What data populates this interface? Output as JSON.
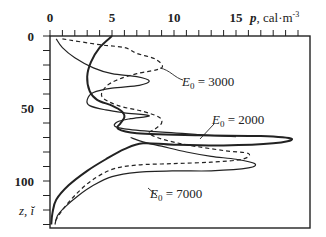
{
  "chart_data": {
    "type": "line",
    "title": "",
    "xlabel": "p, cal·m⁻³",
    "ylabel": "z, ĭ",
    "x_ticks": [
      "0",
      "5",
      "10",
      "15"
    ],
    "y_ticks": [
      "0",
      "50",
      "100"
    ],
    "xlim": [
      0,
      21
    ],
    "ylim": [
      132,
      0
    ],
    "grid": false,
    "axis_position": "x-axis on top, y inverted (depth)",
    "series": [
      {
        "name": "E0 = 2000",
        "style": "solid-thick",
        "points": [
          [
            5,
            0
          ],
          [
            4,
            8
          ],
          [
            3.3,
            18
          ],
          [
            3,
            28
          ],
          [
            3.2,
            38
          ],
          [
            3.8,
            44
          ],
          [
            5,
            48
          ],
          [
            5.8,
            52
          ],
          [
            6,
            56
          ],
          [
            5.7,
            60
          ],
          [
            5.5,
            64
          ],
          [
            7,
            67
          ],
          [
            12,
            68.5
          ],
          [
            17,
            69
          ],
          [
            19.5,
            71
          ],
          [
            18,
            74
          ],
          [
            14,
            75.5
          ],
          [
            10,
            75
          ],
          [
            7.5,
            74
          ],
          [
            6,
            78
          ],
          [
            4.5,
            85
          ],
          [
            3,
            93
          ],
          [
            1.5,
            103
          ],
          [
            0.5,
            113
          ],
          [
            0.2,
            122
          ],
          [
            0.1,
            130
          ]
        ]
      },
      {
        "name": "E0 = 3000",
        "style": "solid-thin",
        "points": [
          [
            0.5,
            2
          ],
          [
            1,
            8
          ],
          [
            2,
            15
          ],
          [
            3.5,
            22
          ],
          [
            5,
            26
          ],
          [
            7,
            28
          ],
          [
            8,
            31
          ],
          [
            7.2,
            34
          ],
          [
            5,
            36
          ],
          [
            3.5,
            39
          ],
          [
            3,
            44
          ],
          [
            3.2,
            48
          ],
          [
            4.5,
            51
          ],
          [
            6,
            53
          ],
          [
            8,
            55
          ],
          [
            6.5,
            57
          ],
          [
            5.5,
            59
          ],
          [
            5.2,
            62
          ],
          [
            6,
            64
          ],
          [
            8.5,
            66
          ],
          [
            12,
            68
          ],
          [
            15,
            69.5
          ]
        ]
      },
      {
        "name": "E0 = 7000",
        "style": "solid-thin",
        "points": [
          [
            6.5,
            70
          ],
          [
            7.5,
            73
          ],
          [
            9,
            76
          ],
          [
            11,
            80
          ],
          [
            13,
            83
          ],
          [
            15,
            85
          ],
          [
            16.5,
            88
          ],
          [
            16,
            91
          ],
          [
            13,
            93
          ],
          [
            10,
            93
          ],
          [
            7,
            94
          ],
          [
            5,
            97
          ],
          [
            3.5,
            103
          ],
          [
            2.3,
            110
          ],
          [
            1.2,
            118
          ],
          [
            0.6,
            124
          ],
          [
            0.4,
            130
          ]
        ]
      },
      {
        "name": "unlabeled dashed",
        "style": "dashed",
        "points": [
          [
            1,
            2
          ],
          [
            4,
            6
          ],
          [
            6,
            8
          ],
          [
            7,
            12
          ],
          [
            8.5,
            16
          ],
          [
            9,
            22
          ],
          [
            7,
            26
          ],
          [
            5.5,
            30
          ],
          [
            4.5,
            35
          ],
          [
            4.2,
            42
          ],
          [
            5.5,
            48
          ],
          [
            7.5,
            52
          ],
          [
            8.8,
            56
          ],
          [
            9,
            60
          ],
          [
            8.5,
            64
          ],
          [
            8,
            67
          ],
          [
            9,
            71
          ],
          [
            11,
            75
          ],
          [
            14,
            79
          ],
          [
            16,
            81
          ],
          [
            15.5,
            85
          ],
          [
            13,
            87
          ],
          [
            10,
            88
          ],
          [
            7,
            89
          ],
          [
            5,
            92
          ],
          [
            3.3,
            100
          ],
          [
            2,
            110
          ],
          [
            1,
            120
          ],
          [
            0.4,
            128
          ]
        ]
      }
    ],
    "annotations": [
      {
        "text_prefix": "E",
        "subscript": "0",
        "text_suffix": " = 3000",
        "x": 9.5,
        "y": 31
      },
      {
        "text_prefix": "E",
        "subscript": "0",
        "text_suffix": " = 2000",
        "x": 11.6,
        "y": 57
      },
      {
        "text_prefix": "E",
        "subscript": "0",
        "text_suffix": " = 7000",
        "x": 8.4,
        "y": 98
      }
    ]
  },
  "labels": {
    "x_axis_title_var": "p",
    "x_axis_title_unit": ", cal·m",
    "x_axis_title_exp": "-3",
    "y_axis_title": "z, ĭ",
    "ann_3000_E": "E",
    "ann_3000_sub": "0",
    "ann_3000_val": " = 3000",
    "ann_2000_E": "E",
    "ann_2000_sub": "0",
    "ann_2000_val": " = 2000",
    "ann_7000_E": "E",
    "ann_7000_sub": "0",
    "ann_7000_val": " = 7000",
    "xt0": "0",
    "xt5": "5",
    "xt10": "10",
    "xt15": "15",
    "yt0": "0",
    "yt50": "50",
    "yt100": "100"
  }
}
